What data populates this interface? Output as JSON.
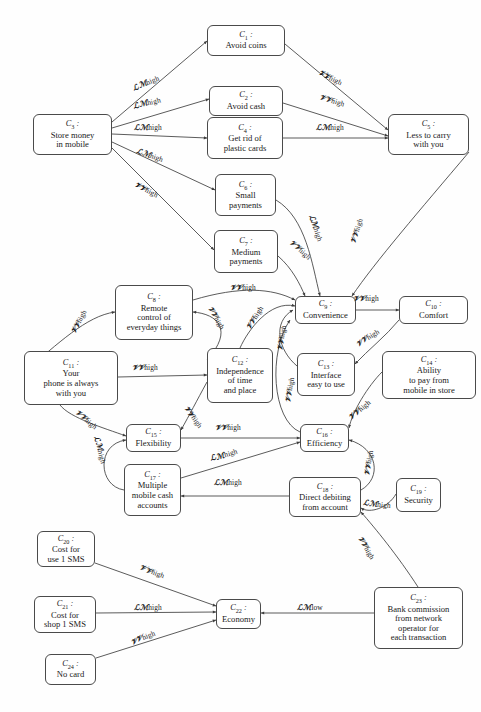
{
  "diagram": {
    "width": 481,
    "height": 712,
    "node_prefix": "C",
    "id_separator": ":",
    "colors": {
      "node_border": "#4a4a4a",
      "node_fill": "#ffffff",
      "edge_stroke": "#3d3d3d",
      "text": "#1a1a1a",
      "background": "#fefefe"
    },
    "weight_labels": {
      "lm_high": "ℒℳhigh",
      "vv_high": "𝒱𝒱high",
      "lm_low": "ℒℳlow"
    },
    "nodes": [
      {
        "id": "C1",
        "num": "1",
        "label": "Avoid coins",
        "x": 207,
        "y": 25,
        "w": 78,
        "h": 31
      },
      {
        "id": "C2",
        "num": "2",
        "label": "Avoid cash",
        "x": 209,
        "y": 86,
        "w": 74,
        "h": 30
      },
      {
        "id": "C3",
        "num": "3",
        "label": "Store money\nin mobile",
        "x": 33,
        "y": 114,
        "w": 79,
        "h": 41
      },
      {
        "id": "C4",
        "num": "4",
        "label": "Get rid of\nplastic cards",
        "x": 207,
        "y": 117,
        "w": 76,
        "h": 42
      },
      {
        "id": "C5",
        "num": "5",
        "label": "Less to carry\nwith you",
        "x": 388,
        "y": 114,
        "w": 81,
        "h": 41
      },
      {
        "id": "C6",
        "num": "6",
        "label": "Small\npayments",
        "x": 215,
        "y": 174,
        "w": 61,
        "h": 42
      },
      {
        "id": "C7",
        "num": "7",
        "label": "Medium\npayments",
        "x": 214,
        "y": 230,
        "w": 64,
        "h": 43
      },
      {
        "id": "C8",
        "num": "8",
        "label": "Remote\ncontrol of\neveryday things",
        "x": 115,
        "y": 285,
        "w": 78,
        "h": 55
      },
      {
        "id": "C9",
        "num": "9",
        "label": "Convenience",
        "x": 295,
        "y": 296,
        "w": 61,
        "h": 28
      },
      {
        "id": "C10",
        "num": "10",
        "label": "Comfort",
        "x": 399,
        "y": 296,
        "w": 69,
        "h": 28
      },
      {
        "id": "C11",
        "num": "11",
        "label": "Your\nphone is always\nwith you",
        "x": 24,
        "y": 351,
        "w": 94,
        "h": 54
      },
      {
        "id": "C12",
        "num": "12",
        "label": "Independence\nof time\nand place",
        "x": 207,
        "y": 348,
        "w": 66,
        "h": 55
      },
      {
        "id": "C13",
        "num": "13",
        "label": "Interface\neasy to use",
        "x": 297,
        "y": 353,
        "w": 58,
        "h": 43
      },
      {
        "id": "C14",
        "num": "14",
        "label": "Ability\nto pay from\nmobile in store",
        "x": 382,
        "y": 351,
        "w": 94,
        "h": 48
      },
      {
        "id": "C15",
        "num": "15",
        "label": "Flexibility",
        "x": 126,
        "y": 424,
        "w": 55,
        "h": 28
      },
      {
        "id": "C16",
        "num": "16",
        "label": "Efficiency",
        "x": 300,
        "y": 424,
        "w": 49,
        "h": 28
      },
      {
        "id": "C17",
        "num": "17",
        "label": "Multiple\nmobile cash\naccounts",
        "x": 124,
        "y": 464,
        "w": 57,
        "h": 52
      },
      {
        "id": "C18",
        "num": "18",
        "label": "Direct debiting\nfrom account",
        "x": 289,
        "y": 477,
        "w": 72,
        "h": 40
      },
      {
        "id": "C19",
        "num": "19",
        "label": "Security",
        "x": 396,
        "y": 478,
        "w": 45,
        "h": 34
      },
      {
        "id": "C20",
        "num": "20",
        "label": "Cost for\nuse 1 SMS",
        "x": 37,
        "y": 531,
        "w": 58,
        "h": 36
      },
      {
        "id": "C21",
        "num": "21",
        "label": "Cost for\nshop 1 SMS",
        "x": 34,
        "y": 596,
        "w": 62,
        "h": 37
      },
      {
        "id": "C22",
        "num": "22",
        "label": "Economy",
        "x": 216,
        "y": 599,
        "w": 45,
        "h": 30
      },
      {
        "id": "C23",
        "num": "23",
        "label": "Bank commission\nfrom network\noperator for\neach transaction",
        "x": 374,
        "y": 587,
        "w": 89,
        "h": 62
      },
      {
        "id": "C24",
        "num": "24",
        "label": "No card",
        "x": 45,
        "y": 654,
        "w": 51,
        "h": 31
      }
    ],
    "edges": [
      {
        "from": "C3",
        "to": "C1",
        "weight": "lm_high",
        "label_x": 146,
        "label_y": 83,
        "rot": -22
      },
      {
        "from": "C3",
        "to": "C2",
        "weight": "lm_high",
        "label_x": 147,
        "label_y": 103,
        "rot": -14
      },
      {
        "from": "C3",
        "to": "C4",
        "weight": "lm_high",
        "label_x": 148,
        "label_y": 127,
        "rot": 0
      },
      {
        "from": "C3",
        "to": "C6",
        "weight": "lm_high",
        "label_x": 150,
        "label_y": 155,
        "rot": 20
      },
      {
        "from": "C3",
        "to": "C7",
        "weight": "vv_high",
        "label_x": 146,
        "label_y": 190,
        "rot": 27
      },
      {
        "from": "C1",
        "to": "C5",
        "weight": "vv_high",
        "label_x": 330,
        "label_y": 78,
        "rot": 26
      },
      {
        "from": "C2",
        "to": "C5",
        "weight": "vv_high",
        "label_x": 332,
        "label_y": 101,
        "rot": 17
      },
      {
        "from": "C4",
        "to": "C5",
        "weight": "lm_high",
        "label_x": 330,
        "label_y": 127,
        "rot": 0
      },
      {
        "from": "C6",
        "to": "C9",
        "weight": "lm_high",
        "label_x": 316,
        "label_y": 228,
        "rot": 72
      },
      {
        "from": "C7",
        "to": "C9",
        "weight": "vv_high",
        "label_x": 300,
        "label_y": 250,
        "rot": 42
      },
      {
        "from": "C5",
        "to": "C9",
        "weight": "vv_high",
        "label_x": 357,
        "label_y": 231,
        "rot": -72
      },
      {
        "from": "C8",
        "to": "C9",
        "weight": "vv_high",
        "label_x": 243,
        "label_y": 288,
        "rot": 0
      },
      {
        "from": "C11",
        "to": "C8",
        "weight": "vv_high",
        "label_x": 79,
        "label_y": 322,
        "rot": -62
      },
      {
        "from": "C12",
        "to": "C8",
        "weight": "vv_high",
        "label_x": 216,
        "label_y": 318,
        "rot": 60
      },
      {
        "from": "C12",
        "to": "C9",
        "weight": "vv_high",
        "label_x": 255,
        "label_y": 318,
        "rot": -58
      },
      {
        "from": "C13",
        "to": "C9",
        "weight": "vv_high",
        "label_x": 282,
        "label_y": 338,
        "rot": -80
      },
      {
        "from": "C16",
        "to": "C9",
        "weight": "vv_high",
        "label_x": 290,
        "label_y": 390,
        "rot": -80
      },
      {
        "from": "C9",
        "to": "C10",
        "weight": "vv_high",
        "label_x": 366,
        "label_y": 299,
        "rot": 0
      },
      {
        "from": "C16",
        "to": "C10",
        "weight": "vv_high",
        "label_x": 368,
        "label_y": 338,
        "rot": -32
      },
      {
        "from": "C11",
        "to": "C12",
        "weight": "vv_high",
        "label_x": 145,
        "label_y": 368,
        "rot": 0
      },
      {
        "from": "C12",
        "to": "C15",
        "weight": "vv_high",
        "label_x": 193,
        "label_y": 417,
        "rot": 55
      },
      {
        "from": "C11",
        "to": "C15",
        "weight": "vv_high",
        "label_x": 86,
        "label_y": 420,
        "rot": 40
      },
      {
        "from": "C15",
        "to": "C16",
        "weight": "vv_high",
        "label_x": 228,
        "label_y": 428,
        "rot": 0
      },
      {
        "from": "C14",
        "to": "C16",
        "weight": "vv_high",
        "label_x": 360,
        "label_y": 410,
        "rot": -40
      },
      {
        "from": "C17",
        "to": "C15",
        "weight": "lm_high",
        "label_x": 100,
        "label_y": 450,
        "rot": 75
      },
      {
        "from": "C17",
        "to": "C16",
        "weight": "lm_high",
        "label_x": 224,
        "label_y": 455,
        "rot": -17
      },
      {
        "from": "C18",
        "to": "C17",
        "weight": "lm_high",
        "label_x": 228,
        "label_y": 482,
        "rot": 0
      },
      {
        "from": "C18",
        "to": "C16",
        "weight": "vv_high",
        "label_x": 369,
        "label_y": 463,
        "rot": -80
      },
      {
        "from": "C19",
        "to": "C18",
        "weight": "lm_high",
        "label_x": 377,
        "label_y": 504,
        "rot": 6
      },
      {
        "from": "C23",
        "to": "C18",
        "weight": "vv_high",
        "label_x": 366,
        "label_y": 548,
        "rot": 60
      },
      {
        "from": "C20",
        "to": "C22",
        "weight": "vv_high",
        "label_x": 152,
        "label_y": 572,
        "rot": 20
      },
      {
        "from": "C21",
        "to": "C22",
        "weight": "lm_high",
        "label_x": 148,
        "label_y": 607,
        "rot": 0
      },
      {
        "from": "C24",
        "to": "C22",
        "weight": "vv_high",
        "label_x": 143,
        "label_y": 638,
        "rot": -22
      },
      {
        "from": "C23",
        "to": "C22",
        "weight": "lm_low",
        "label_x": 310,
        "label_y": 607,
        "rot": 0
      }
    ],
    "edge_paths": [
      "M112,122 L207,41",
      "M112,128 L209,99",
      "M112,134 L207,138",
      "M112,142 L215,190",
      "M112,148 L214,250",
      "M285,44 L388,130",
      "M283,103 L388,136",
      "M283,138 L388,138",
      "M276,200 C306,218 312,264 320,296",
      "M278,256 C292,268 300,284 305,296",
      "M469,152 C420,210 375,262 352,296",
      "M193,300 C240,286 272,288 295,300",
      "M24,372 C58,344 86,316 115,312",
      "M207,360 C234,330 218,314 193,312",
      "M240,348 C248,330 270,300 295,306",
      "M297,366 C278,350 272,322 293,310",
      "M300,432 C272,420 268,352 290,320",
      "M356,310 L399,310",
      "M399,320 C386,336 368,350 355,364",
      "M118,377 L207,375",
      "M207,382 C196,402 190,414 181,430",
      "M60,405 C70,418 104,428 126,436",
      "M181,438 L300,438",
      "M382,372 C368,386 352,412 349,428",
      "M124,490 C98,486 96,444 126,440",
      "M181,478 L300,442",
      "M289,496 L181,496",
      "M361,490 C382,478 378,448 349,440",
      "M396,494 C388,508 370,514 361,508",
      "M418,587 C398,556 375,528 361,512",
      "M95,563 L216,606",
      "M96,613 L216,612",
      "M96,658 L216,620",
      "M374,613 L261,613"
    ]
  }
}
